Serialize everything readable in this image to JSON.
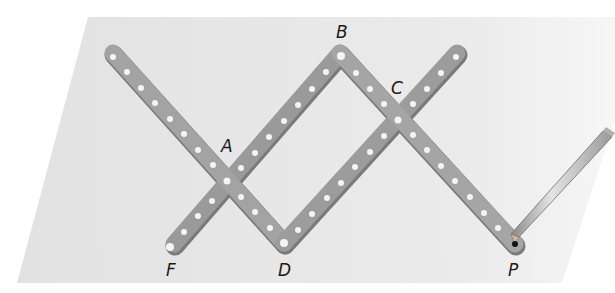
{
  "figure": {
    "background_color": "#e6e6e6",
    "bar_color": "#9d9d9d",
    "bar_shadow_color": "#7a7a7a",
    "hole_color": "#f4f4f4",
    "labels": {
      "A": "A",
      "B": "B",
      "C": "C",
      "D": "D",
      "F": "F",
      "P": "P"
    },
    "points": {
      "F": [
        174,
        244
      ],
      "A": [
        229,
        181
      ],
      "B": [
        340,
        53
      ],
      "C": [
        398,
        118
      ],
      "D": [
        284,
        243
      ],
      "P": [
        515,
        244
      ]
    },
    "bars": [
      {
        "name": "bar-top-left-to-D",
        "from": [
          113,
          53
        ],
        "to": [
          284,
          243
        ]
      },
      {
        "name": "bar-F-to-B",
        "from": [
          174,
          244
        ],
        "to": [
          340,
          53
        ]
      },
      {
        "name": "bar-B-to-P",
        "from": [
          340,
          53
        ],
        "to": [
          515,
          244
        ]
      },
      {
        "name": "bar-D-to-top-right",
        "from": [
          284,
          243
        ],
        "to": [
          457,
          53
        ]
      }
    ],
    "pencil": {
      "tip": [
        515,
        240
      ],
      "end": [
        610,
        133
      ]
    }
  }
}
